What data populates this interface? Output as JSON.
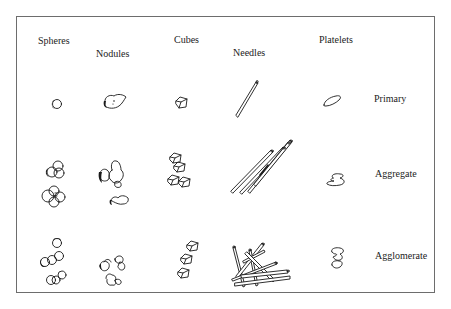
{
  "figure": {
    "column_headers": [
      {
        "id": "spheres",
        "label": "Spheres"
      },
      {
        "id": "nodules",
        "label": "Nodules"
      },
      {
        "id": "cubes",
        "label": "Cubes"
      },
      {
        "id": "needles",
        "label": "Needles"
      },
      {
        "id": "platelets",
        "label": "Platelets"
      }
    ],
    "row_labels": [
      {
        "id": "primary",
        "label": "Primary"
      },
      {
        "id": "aggregate",
        "label": "Aggregate"
      },
      {
        "id": "agglomerate",
        "label": "Agglomerate"
      }
    ],
    "cells": [
      {
        "row": "primary",
        "shape": "spheres",
        "depiction": "single sphere"
      },
      {
        "row": "primary",
        "shape": "nodules",
        "depiction": "single nodule"
      },
      {
        "row": "primary",
        "shape": "cubes",
        "depiction": "single cube"
      },
      {
        "row": "primary",
        "shape": "needles",
        "depiction": "single needle"
      },
      {
        "row": "primary",
        "shape": "platelets",
        "depiction": "single platelet"
      },
      {
        "row": "aggregate",
        "shape": "spheres",
        "depiction": "fused sphere clusters"
      },
      {
        "row": "aggregate",
        "shape": "nodules",
        "depiction": "fused nodule clusters"
      },
      {
        "row": "aggregate",
        "shape": "cubes",
        "depiction": "fused cube stack"
      },
      {
        "row": "aggregate",
        "shape": "needles",
        "depiction": "parallel fused needles"
      },
      {
        "row": "aggregate",
        "shape": "platelets",
        "depiction": "fused platelets"
      },
      {
        "row": "agglomerate",
        "shape": "spheres",
        "depiction": "loosely touching spheres"
      },
      {
        "row": "agglomerate",
        "shape": "nodules",
        "depiction": "loosely touching nodules"
      },
      {
        "row": "agglomerate",
        "shape": "cubes",
        "depiction": "loosely touching cubes"
      },
      {
        "row": "agglomerate",
        "shape": "needles",
        "depiction": "randomly crossed needles"
      },
      {
        "row": "agglomerate",
        "shape": "platelets",
        "depiction": "loosely touching platelets"
      }
    ]
  }
}
